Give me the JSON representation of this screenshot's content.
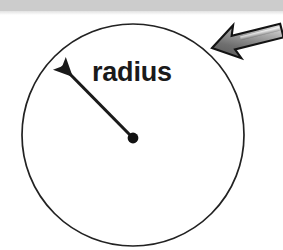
{
  "figure": {
    "kind": "geometry-diagram",
    "background_color": "#ffffff",
    "top_band": {
      "color": "#cccccc",
      "height_px": 11
    },
    "labels": {
      "radius": "radius"
    },
    "circle": {
      "center_x": 133,
      "center_y": 135,
      "radius_px": 111,
      "stroke_color": "#1a1a1a",
      "stroke_width": 1.6,
      "fill": "none"
    },
    "center_dot": {
      "x": 133,
      "y": 138,
      "r": 5,
      "color": "#111111"
    },
    "radius_arrow": {
      "from_x": 133,
      "from_y": 138,
      "to_x": 57,
      "to_y": 61,
      "color": "#1a1a1a",
      "stroke_width": 3.2,
      "head": "solid-triangle"
    },
    "pointer_arrow": {
      "tip_x": 212,
      "tip_y": 48,
      "tail_x": 283,
      "tail_y": 30,
      "outline_color": "#1a1a1a",
      "fill_light": "#f2f2f2",
      "fill_mid": "#9a9a9a",
      "fill_dark": "#5e5e5e",
      "style": "3d-block-arrow"
    }
  }
}
